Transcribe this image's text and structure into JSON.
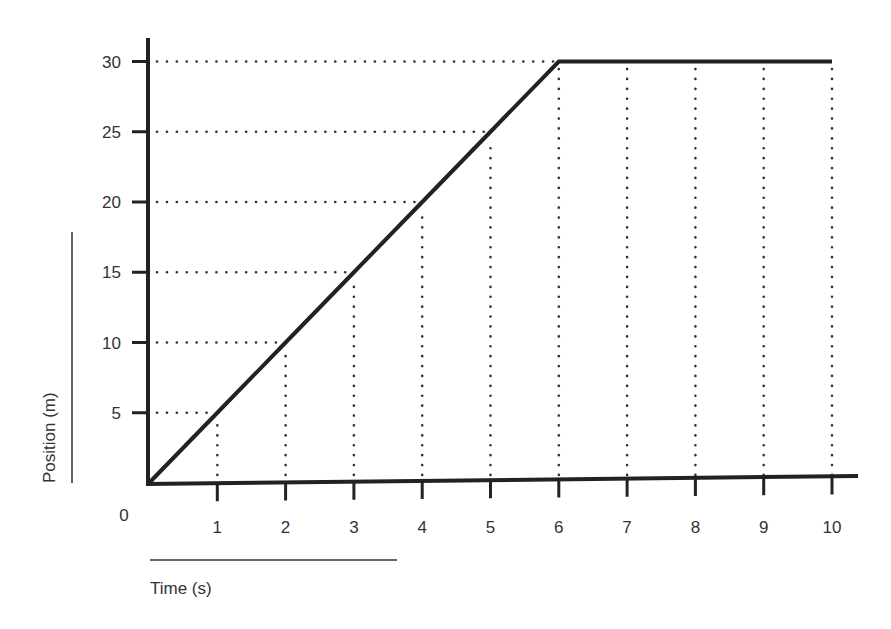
{
  "chart_data": {
    "type": "line",
    "title": "",
    "xlabel": "Time (s)",
    "ylabel": "Position (m)",
    "origin_label": "0",
    "xlim": [
      0,
      10
    ],
    "ylim": [
      0,
      30
    ],
    "x_ticks": [
      1,
      2,
      3,
      4,
      5,
      6,
      7,
      8,
      9,
      10
    ],
    "y_ticks": [
      5,
      10,
      15,
      20,
      25,
      30
    ],
    "grid": "dotted reference lines from data points to axes",
    "legend": null,
    "series": [
      {
        "name": "Position vs Time",
        "x": [
          0,
          1,
          2,
          3,
          4,
          5,
          6,
          7,
          8,
          9,
          10
        ],
        "y": [
          0,
          5,
          10,
          15,
          20,
          25,
          30,
          30,
          30,
          30,
          30
        ],
        "color": "#222222"
      }
    ],
    "annotations": [
      "Constant velocity of 5 m/s from t=0 to t=6 s",
      "At rest at 30 m from t=6 to t=10 s"
    ]
  },
  "colors": {
    "line": "#222222",
    "axis": "#222222",
    "grid_dots": "#333333",
    "text": "#333333",
    "background": "#ffffff"
  }
}
